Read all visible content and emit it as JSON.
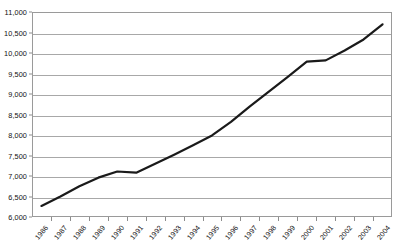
{
  "chart_data": {
    "type": "line",
    "title": "",
    "subtitle": "",
    "xlabel": "",
    "ylabel": "",
    "categories": [
      "1986",
      "1987",
      "1988",
      "1989",
      "1990",
      "1991",
      "1992",
      "1993",
      "1994",
      "1995",
      "1996",
      "1997",
      "1998",
      "1999",
      "2000",
      "2001",
      "2002",
      "2003",
      "2004"
    ],
    "values": [
      6270,
      6500,
      6750,
      6960,
      7110,
      7080,
      7300,
      7520,
      7750,
      7990,
      8320,
      8700,
      9060,
      9420,
      9790,
      9820,
      10060,
      10330,
      10700
    ],
    "series": [
      {
        "name": "",
        "values": [
          6270,
          6500,
          6750,
          6960,
          7110,
          7080,
          7300,
          7520,
          7750,
          7990,
          8320,
          8700,
          9060,
          9420,
          9790,
          9820,
          10060,
          10330,
          10700
        ]
      }
    ],
    "ylim": [
      6000,
      11000
    ],
    "ytick_step": 500,
    "ytick_labels": [
      "6,000",
      "6,500",
      "7,000",
      "7,500",
      "8,000",
      "8,500",
      "9,000",
      "9,500",
      "10,000",
      "10,500",
      "11,000"
    ],
    "ytick_values": [
      6000,
      6500,
      7000,
      7500,
      8000,
      8500,
      9000,
      9500,
      10000,
      10500,
      11000
    ],
    "grid": true,
    "grid_axis": "y",
    "legend": false,
    "legend_position": "none",
    "line_color": "#1a1a1a",
    "line_width": 2.2,
    "grid_color": "#a8a8a8",
    "frame_color": "#9a9a9a",
    "background_color": "#ffffff",
    "text_color": "#111111",
    "xtick_label_rotation": -50,
    "annotations": []
  }
}
